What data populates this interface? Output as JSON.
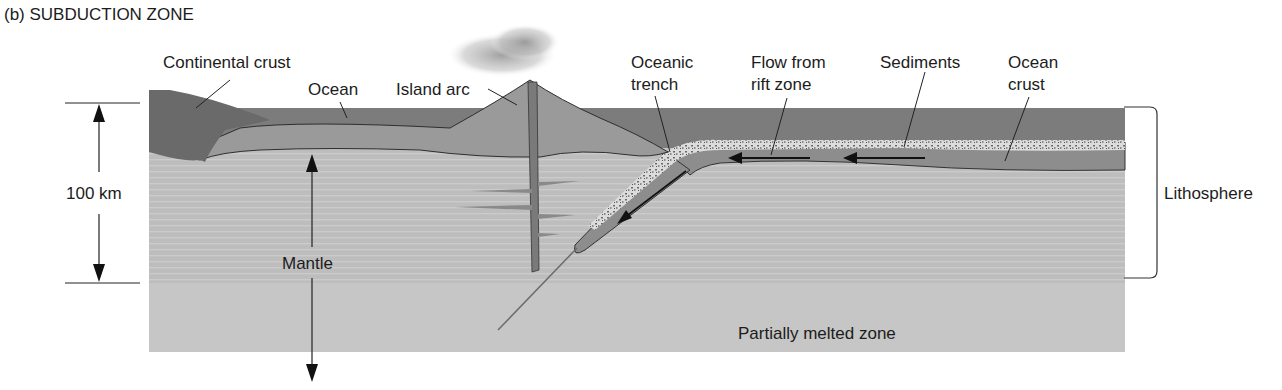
{
  "figure": {
    "title": "(b) SUBDUCTION ZONE",
    "colors": {
      "background": "#ffffff",
      "ocean": "#7a7a7a",
      "continental_crust": "#6e6e6e",
      "crust_medium": "#9a9a9a",
      "lithosphere_mantle": "#b9b9b9",
      "asthenosphere": "#c4c4c4",
      "sediments": "#d8d8d8",
      "ink": "#1c1c1c"
    }
  },
  "labels": {
    "continental_crust": "Continental crust",
    "ocean": "Ocean",
    "island_arc": "Island arc",
    "oceanic_trench_line1": "Oceanic",
    "oceanic_trench_line2": "trench",
    "flow_line1": "Flow from",
    "flow_line2": "rift zone",
    "sediments": "Sediments",
    "ocean_crust_line1": "Ocean",
    "ocean_crust_line2": "crust",
    "lithosphere": "Lithosphere",
    "mantle": "Mantle",
    "partially_melted_zone": "Partially melted zone",
    "scale": "100 km"
  }
}
